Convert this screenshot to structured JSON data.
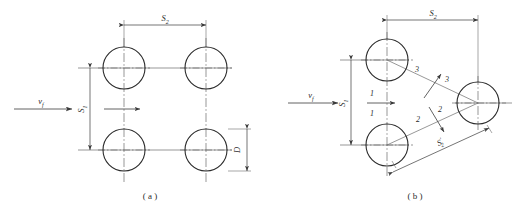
{
  "figure": {
    "background_color": "#ffffff",
    "line_color": "#3a3a3a",
    "centerline_color": "#6b6b6b",
    "text_color": "#2b2b2b"
  },
  "panels": [
    {
      "id": "a",
      "caption": "( a )",
      "arrangement": "in-line",
      "flow_label": "v",
      "flow_label_sub": "f",
      "dimensions": [
        {
          "name": "transverse-pitch",
          "symbol": "S",
          "sub": "1",
          "orientation": "vertical"
        },
        {
          "name": "longitudinal-pitch",
          "symbol": "S",
          "sub": "2",
          "orientation": "horizontal"
        },
        {
          "name": "tube-diameter",
          "symbol": "D",
          "sub": "",
          "orientation": "vertical"
        }
      ],
      "tubes": [
        {
          "cx": 124,
          "cy": 68,
          "r": 21
        },
        {
          "cx": 206,
          "cy": 68,
          "r": 21
        },
        {
          "cx": 124,
          "cy": 150,
          "r": 21
        },
        {
          "cx": 206,
          "cy": 150,
          "r": 21
        }
      ]
    },
    {
      "id": "b",
      "caption": "( b )",
      "arrangement": "staggered",
      "flow_label": "v",
      "flow_label_sub": "f",
      "dimensions": [
        {
          "name": "transverse-pitch",
          "symbol": "S",
          "sub": "1",
          "orientation": "vertical"
        },
        {
          "name": "longitudinal-pitch",
          "symbol": "S",
          "sub": "2",
          "orientation": "horizontal"
        },
        {
          "name": "diagonal-pitch",
          "symbol": "S",
          "sub": "2",
          "prime": "'",
          "orientation": "diagonal"
        }
      ],
      "channel_labels": [
        {
          "text": "1",
          "position": "upper-of-horizontal-arrow"
        },
        {
          "text": "1",
          "position": "lower-of-horizontal-arrow"
        },
        {
          "text": "2",
          "position": "left-of-lower-diagonal-arrow"
        },
        {
          "text": "2",
          "position": "right-of-lower-diagonal-arrow"
        },
        {
          "text": "3",
          "position": "left-of-upper-diagonal-arrow"
        },
        {
          "text": "3",
          "position": "right-of-upper-diagonal-arrow"
        }
      ],
      "tubes": [
        {
          "cx": 387,
          "cy": 60,
          "r": 21
        },
        {
          "cx": 387,
          "cy": 145,
          "r": 21
        },
        {
          "cx": 478,
          "cy": 103,
          "r": 21
        }
      ]
    }
  ]
}
